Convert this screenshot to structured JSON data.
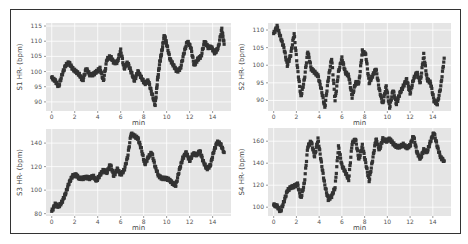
{
  "figure": {
    "background": "#ffffff",
    "plot_background": "#e5e5e5",
    "grid_color": "#ffffff",
    "marker_color": "#333333"
  },
  "chart_data": [
    {
      "type": "scatter",
      "title": "",
      "xlabel": "min",
      "ylabel": "S1 HR- (bpm)",
      "xticks": [
        0,
        2,
        4,
        6,
        8,
        10,
        12,
        14
      ],
      "yticks": [
        90,
        95,
        100,
        105,
        110,
        115
      ],
      "xlim": [
        -0.5,
        15.6
      ],
      "ylim": [
        87,
        116
      ],
      "grid": true,
      "x": [
        0,
        0.3,
        0.6,
        0.9,
        1.2,
        1.5,
        1.8,
        2.1,
        2.4,
        2.7,
        3.0,
        3.3,
        3.6,
        3.9,
        4.2,
        4.5,
        4.8,
        5.1,
        5.4,
        5.7,
        6.0,
        6.3,
        6.6,
        6.9,
        7.2,
        7.5,
        7.8,
        8.1,
        8.4,
        8.7,
        9.0,
        9.2,
        9.4,
        9.6,
        9.8,
        10.0,
        10.3,
        10.6,
        10.9,
        11.2,
        11.5,
        11.8,
        12.1,
        12.4,
        12.7,
        13.0,
        13.3,
        13.6,
        13.9,
        14.2,
        14.5,
        14.8,
        15.0
      ],
      "values": [
        98,
        97,
        95,
        99,
        102,
        103,
        101,
        100,
        99,
        97,
        101,
        99,
        99,
        100,
        101,
        97,
        104,
        105,
        103,
        103,
        107,
        101,
        103,
        100,
        97,
        100,
        98,
        96,
        97,
        93,
        89,
        97,
        103,
        107,
        112,
        109,
        104,
        102,
        100,
        101,
        106,
        110,
        108,
        102,
        104,
        105,
        110,
        108,
        108,
        106,
        108,
        114,
        109
      ]
    },
    {
      "type": "scatter",
      "title": "",
      "xlabel": "min",
      "ylabel": "S2 HR- (bpm)",
      "xticks": [
        0,
        2,
        4,
        6,
        8,
        10,
        12,
        14
      ],
      "yticks": [
        90,
        95,
        100,
        105,
        110
      ],
      "xlim": [
        -0.5,
        15.6
      ],
      "ylim": [
        87,
        112
      ],
      "grid": true,
      "x": [
        0,
        0.3,
        0.6,
        0.9,
        1.2,
        1.5,
        1.8,
        2.1,
        2.4,
        2.7,
        3.0,
        3.3,
        3.6,
        3.9,
        4.2,
        4.5,
        4.8,
        5.1,
        5.4,
        5.7,
        6.0,
        6.3,
        6.6,
        6.9,
        7.2,
        7.5,
        7.8,
        8.1,
        8.4,
        8.7,
        9.0,
        9.3,
        9.6,
        9.9,
        10.2,
        10.5,
        10.8,
        11.1,
        11.4,
        11.7,
        12.0,
        12.3,
        12.6,
        12.9,
        13.2,
        13.5,
        13.8,
        14.1,
        14.4,
        14.7,
        15.0
      ],
      "values": [
        109,
        111,
        108,
        105,
        100,
        103,
        109,
        99,
        91,
        96,
        104,
        99,
        98,
        97,
        93,
        88,
        96,
        102,
        90,
        98,
        102,
        98,
        97,
        91,
        95,
        95,
        104,
        103,
        95,
        97,
        99,
        93,
        89,
        94,
        88,
        93,
        89,
        92,
        94,
        96,
        92,
        96,
        98,
        95,
        103,
        96,
        95,
        90,
        89,
        94,
        102
      ]
    },
    {
      "type": "scatter",
      "title": "",
      "xlabel": "min",
      "ylabel": "S3 HR- (bpm)",
      "xticks": [
        0,
        2,
        4,
        6,
        8,
        10,
        12,
        14
      ],
      "yticks": [
        80,
        100,
        120,
        140
      ],
      "xlim": [
        -0.5,
        15.6
      ],
      "ylim": [
        78,
        152
      ],
      "grid": true,
      "x": [
        0,
        0.3,
        0.6,
        0.9,
        1.2,
        1.5,
        1.8,
        2.1,
        2.4,
        2.7,
        3.0,
        3.3,
        3.6,
        3.9,
        4.2,
        4.5,
        4.8,
        5.1,
        5.4,
        5.7,
        6.0,
        6.3,
        6.6,
        6.9,
        7.2,
        7.5,
        7.8,
        8.1,
        8.4,
        8.7,
        9.0,
        9.3,
        9.6,
        9.9,
        10.2,
        10.5,
        10.8,
        11.1,
        11.4,
        11.7,
        12.0,
        12.3,
        12.6,
        12.9,
        13.2,
        13.5,
        13.8,
        14.1,
        14.4,
        14.7,
        15.0
      ],
      "values": [
        82,
        88,
        86,
        90,
        97,
        106,
        112,
        113,
        110,
        110,
        111,
        110,
        112,
        108,
        113,
        117,
        115,
        122,
        112,
        118,
        113,
        117,
        128,
        148,
        146,
        144,
        135,
        122,
        128,
        132,
        120,
        112,
        110,
        110,
        109,
        106,
        104,
        117,
        127,
        132,
        125,
        131,
        130,
        133,
        124,
        118,
        121,
        133,
        141,
        139,
        132
      ]
    },
    {
      "type": "scatter",
      "title": "",
      "xlabel": "min",
      "ylabel": "S4 HR- (bpm)",
      "xticks": [
        0,
        2,
        4,
        6,
        8,
        10,
        12,
        14
      ],
      "yticks": [
        100,
        120,
        140,
        160
      ],
      "xlim": [
        -0.5,
        15.6
      ],
      "ylim": [
        92,
        172
      ],
      "grid": true,
      "x": [
        0,
        0.3,
        0.6,
        0.9,
        1.2,
        1.5,
        1.8,
        2.1,
        2.4,
        2.7,
        3.0,
        3.3,
        3.6,
        3.9,
        4.2,
        4.5,
        4.8,
        5.1,
        5.4,
        5.7,
        6.0,
        6.3,
        6.6,
        6.9,
        7.2,
        7.5,
        7.8,
        8.1,
        8.4,
        8.7,
        9.0,
        9.3,
        9.6,
        9.9,
        10.2,
        10.5,
        10.8,
        11.1,
        11.4,
        11.7,
        12.0,
        12.3,
        12.6,
        12.9,
        13.2,
        13.5,
        13.8,
        14.1,
        14.4,
        14.7,
        15.0
      ],
      "values": [
        102,
        101,
        96,
        105,
        115,
        118,
        119,
        121,
        108,
        122,
        155,
        160,
        146,
        162,
        140,
        120,
        107,
        110,
        118,
        155,
        138,
        132,
        125,
        158,
        162,
        143,
        156,
        140,
        124,
        143,
        162,
        152,
        162,
        160,
        162,
        158,
        155,
        155,
        157,
        154,
        156,
        165,
        150,
        144,
        152,
        150,
        160,
        168,
        155,
        145,
        142
      ]
    }
  ]
}
